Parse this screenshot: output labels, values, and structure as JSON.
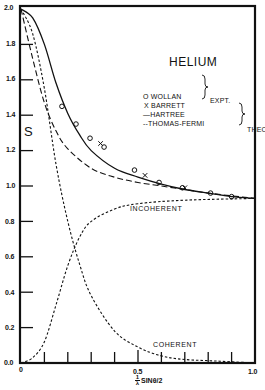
{
  "chart_data": {
    "type": "line",
    "title": "HELIUM",
    "xlabel": "1/λ SINθ/2",
    "ylabel": "S",
    "xlim": [
      0,
      1.0
    ],
    "ylim": [
      0,
      2.0
    ],
    "x_ticks": [
      "0",
      "0.5",
      "1.0"
    ],
    "y_ticks": [
      "0.0",
      "0.2",
      "0.4",
      "0.6",
      "0.8",
      "1.0",
      "1.2",
      "1.4",
      "1.6",
      "1.8",
      "2.0"
    ],
    "grid": false,
    "legend": {
      "position": "upper right",
      "groups": [
        {
          "label": "EXPT.",
          "entries": [
            "WOLLAN",
            "BARRETT"
          ]
        },
        {
          "label": "THEORY",
          "entries": [
            "HARTREE",
            "THOMAS-FERMI"
          ]
        }
      ]
    },
    "series": [
      {
        "name": "HARTREE",
        "style": "solid",
        "x": [
          0,
          0.05,
          0.1,
          0.15,
          0.2,
          0.25,
          0.3,
          0.4,
          0.5,
          0.6,
          0.7,
          0.8,
          0.9,
          1.0
        ],
        "y": [
          2.0,
          1.95,
          1.8,
          1.58,
          1.41,
          1.29,
          1.2,
          1.1,
          1.05,
          1.01,
          0.98,
          0.96,
          0.94,
          0.93
        ]
      },
      {
        "name": "THOMAS-FERMI",
        "style": "long-dash",
        "x": [
          0,
          0.05,
          0.1,
          0.15,
          0.2,
          0.3,
          0.4,
          0.5,
          0.6,
          0.7,
          0.8,
          1.0
        ],
        "y": [
          2.0,
          1.72,
          1.47,
          1.31,
          1.21,
          1.1,
          1.05,
          1.02,
          1.0,
          0.98,
          0.96,
          0.93
        ]
      },
      {
        "name": "COHERENT",
        "style": "short-dash",
        "x": [
          0,
          0.05,
          0.1,
          0.15,
          0.2,
          0.25,
          0.3,
          0.4,
          0.5,
          0.6,
          0.7,
          0.85,
          1.0
        ],
        "y": [
          2.0,
          1.86,
          1.55,
          1.12,
          0.8,
          0.56,
          0.38,
          0.18,
          0.09,
          0.04,
          0.02,
          0.01,
          0.0
        ]
      },
      {
        "name": "INCOHERENT",
        "style": "short-dash",
        "x": [
          0,
          0.05,
          0.1,
          0.15,
          0.2,
          0.25,
          0.3,
          0.4,
          0.5,
          0.7,
          1.0
        ],
        "y": [
          0,
          0.03,
          0.12,
          0.33,
          0.55,
          0.71,
          0.8,
          0.87,
          0.9,
          0.92,
          0.93
        ]
      },
      {
        "name": "WOLLAN",
        "style": "marker-circle",
        "x": [
          0.175,
          0.235,
          0.295,
          0.355,
          0.485,
          0.59,
          0.69,
          0.81,
          0.9
        ],
        "y": [
          1.45,
          1.35,
          1.27,
          1.22,
          1.09,
          1.02,
          0.99,
          0.96,
          0.94
        ]
      },
      {
        "name": "BARRETT",
        "style": "marker-x",
        "x": [
          0.34,
          0.53,
          0.7
        ],
        "y": [
          1.24,
          1.06,
          0.99
        ]
      }
    ]
  },
  "labels": {
    "title": "HELIUM",
    "ylabel": "S",
    "xlabel": "1/λ SINθ/2",
    "x_tick_0": "0",
    "x_tick_05": "0.5",
    "x_tick_1": "1.0",
    "y_tick_00": "0.0",
    "y_tick_02": "0.2",
    "y_tick_04": "0.4",
    "y_tick_06": "0.6",
    "y_tick_08": "0.8",
    "y_tick_10": "1.0",
    "y_tick_12": "1.2",
    "y_tick_14": "1.4",
    "y_tick_16": "1.6",
    "y_tick_18": "1.8",
    "y_tick_20": "2.0",
    "legend_wollan": "O WOLLAN",
    "legend_barrett": "X BARRETT",
    "legend_hartree": "—HARTREE",
    "legend_thomas_fermi": "--THOMAS-FERMI",
    "legend_expt": "EXPT.",
    "legend_theory": "THEORY",
    "incoherent": "INCOHERENT",
    "coherent": "COHERENT"
  }
}
